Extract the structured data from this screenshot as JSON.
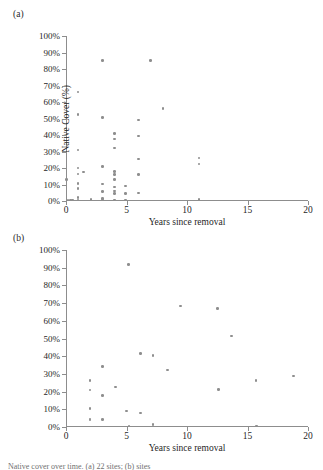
{
  "figure": {
    "panels": [
      {
        "id": "a",
        "label": "(a)",
        "has_y_title": true
      },
      {
        "id": "b",
        "label": "(b)",
        "has_y_title": false
      }
    ],
    "caption": "Native cover over time. (a) 22 sites; (b) sites"
  },
  "chart_data": [
    {
      "type": "scatter",
      "panel": "(a)",
      "title": "",
      "xlabel": "Years since removal",
      "ylabel": "Native Cover (%)",
      "xlim": [
        0,
        20
      ],
      "ylim": [
        0,
        100
      ],
      "xticks": [
        0,
        5,
        10,
        15,
        20
      ],
      "xticklabels": [
        "0",
        "5",
        "10",
        "15",
        "20"
      ],
      "yticks": [
        0,
        10,
        20,
        30,
        40,
        50,
        60,
        70,
        80,
        90,
        100
      ],
      "yticklabels": [
        "0%",
        "10%",
        "20%",
        "30%",
        "40%",
        "50%",
        "60%",
        "70%",
        "80%",
        "90%",
        "100%"
      ],
      "grid": false,
      "legend": null,
      "marker_color": "#8e8e8e",
      "points": [
        [
          0.05,
          13.0
        ],
        [
          0.15,
          0.5
        ],
        [
          0.35,
          0.5
        ],
        [
          0.55,
          0.5
        ],
        [
          1.0,
          66.0
        ],
        [
          1.0,
          52.5
        ],
        [
          1.0,
          30.8
        ],
        [
          1.0,
          20.0
        ],
        [
          1.0,
          16.3
        ],
        [
          1.0,
          10.5
        ],
        [
          1.0,
          7.5
        ],
        [
          1.0,
          2.0
        ],
        [
          1.0,
          0.5
        ],
        [
          1.45,
          17.5
        ],
        [
          2.05,
          0.8
        ],
        [
          3.0,
          85.0
        ],
        [
          3.0,
          50.5
        ],
        [
          3.0,
          20.8
        ],
        [
          3.0,
          10.3
        ],
        [
          3.0,
          5.8
        ],
        [
          3.0,
          1.5
        ],
        [
          3.0,
          0.5
        ],
        [
          4.0,
          41.0
        ],
        [
          4.0,
          37.5
        ],
        [
          4.0,
          32.2
        ],
        [
          4.0,
          17.8
        ],
        [
          4.0,
          16.0
        ],
        [
          4.0,
          13.0
        ],
        [
          4.0,
          8.5
        ],
        [
          4.0,
          6.0
        ],
        [
          4.0,
          4.5
        ],
        [
          4.0,
          0.5
        ],
        [
          4.9,
          9.0
        ],
        [
          4.9,
          4.5
        ],
        [
          4.9,
          0.5
        ],
        [
          6.0,
          49.0
        ],
        [
          6.0,
          39.5
        ],
        [
          6.0,
          25.5
        ],
        [
          6.0,
          16.0
        ],
        [
          6.0,
          4.8
        ],
        [
          7.0,
          85.0
        ],
        [
          8.0,
          56.0
        ],
        [
          11.0,
          26.0
        ],
        [
          11.0,
          22.5
        ],
        [
          11.0,
          0.8
        ]
      ]
    },
    {
      "type": "scatter",
      "panel": "(b)",
      "title": "",
      "xlabel": "Years since removal",
      "ylabel": "",
      "xlim": [
        0,
        20
      ],
      "ylim": [
        0,
        100
      ],
      "xticks": [
        0,
        5,
        10,
        15,
        20
      ],
      "xticklabels": [
        "0",
        "5",
        "10",
        "15",
        "20"
      ],
      "yticks": [
        0,
        10,
        20,
        30,
        40,
        50,
        60,
        70,
        80,
        90,
        100
      ],
      "yticklabels": [
        "0%",
        "10%",
        "20%",
        "30%",
        "40%",
        "50%",
        "60%",
        "70%",
        "80%",
        "90%",
        "100%"
      ],
      "grid": false,
      "legend": null,
      "marker_color": "#8e8e8e",
      "points": [
        [
          2.0,
          26.3
        ],
        [
          2.0,
          21.0
        ],
        [
          2.0,
          10.3
        ],
        [
          2.0,
          4.6
        ],
        [
          2.0,
          4.0
        ],
        [
          3.0,
          34.3
        ],
        [
          3.0,
          17.8
        ],
        [
          3.0,
          4.3
        ],
        [
          4.1,
          22.5
        ],
        [
          5.0,
          9.0
        ],
        [
          5.15,
          91.8
        ],
        [
          5.2,
          0.5
        ],
        [
          6.15,
          41.5
        ],
        [
          6.15,
          7.8
        ],
        [
          7.2,
          40.3
        ],
        [
          7.2,
          1.3
        ],
        [
          8.4,
          32.3
        ],
        [
          9.45,
          68.3
        ],
        [
          12.5,
          66.8
        ],
        [
          12.6,
          21.3
        ],
        [
          13.7,
          51.5
        ],
        [
          15.7,
          26.3
        ],
        [
          15.75,
          0.5
        ],
        [
          18.8,
          28.8
        ]
      ]
    }
  ]
}
